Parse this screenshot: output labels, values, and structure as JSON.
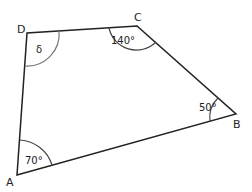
{
  "diagram": {
    "type": "quadrilateral",
    "vertices": [
      {
        "label": "A",
        "x": 17,
        "y": 175
      },
      {
        "label": "B",
        "x": 236,
        "y": 114
      },
      {
        "label": "C",
        "x": 137,
        "y": 26
      },
      {
        "label": "D",
        "x": 27,
        "y": 33
      }
    ],
    "angles": [
      {
        "vertex": "A",
        "label": "70°"
      },
      {
        "vertex": "B",
        "label": "50°"
      },
      {
        "vertex": "C",
        "label": "140°"
      },
      {
        "vertex": "D",
        "label": "δ"
      }
    ],
    "colors": {
      "stroke": "#222222",
      "arc": "#666666"
    }
  }
}
